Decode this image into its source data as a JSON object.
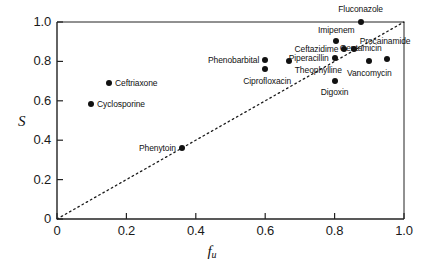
{
  "chart_data": {
    "type": "scatter",
    "title": "",
    "xlabel": "f_u",
    "xlabel_main": "f",
    "xlabel_sub": "u",
    "ylabel": "S",
    "xlim": [
      0,
      1.0
    ],
    "ylim": [
      0,
      1.0
    ],
    "xticks": [
      "0",
      "0.2",
      "0.4",
      "0.6",
      "0.8",
      "1.0"
    ],
    "xtick_values": [
      0,
      0.2,
      0.4,
      0.6,
      0.8,
      1.0
    ],
    "yticks": [
      "0",
      "0.2",
      "0.4",
      "0.6",
      "0.8",
      "1.0"
    ],
    "ytick_values": [
      0,
      0.2,
      0.4,
      0.6,
      0.8,
      1.0
    ],
    "grid": false,
    "legend": false,
    "marker_color": "#111111",
    "axis_color": "#222222",
    "reference_line": {
      "name": "identity-line",
      "style": "dotted",
      "from": [
        0,
        0
      ],
      "to": [
        1.0,
        1.0
      ]
    },
    "points": [
      {
        "label": "Fluconazole",
        "x": 0.875,
        "y": 1.0,
        "label_pos": "c",
        "dx": 0,
        "dy": -13
      },
      {
        "label": "Imipenem",
        "x": 0.805,
        "y": 0.905,
        "label_pos": "c",
        "dx": 0,
        "dy": -11
      },
      {
        "label": "Procainamide",
        "x": 0.855,
        "y": 0.865,
        "label_pos": "l",
        "dx": 6,
        "dy": -8
      },
      {
        "label": "Ceftazidime",
        "x": 0.828,
        "y": 0.865,
        "label_pos": "r",
        "dx": -6,
        "dy": 0
      },
      {
        "label": "Gentamicin",
        "x": 0.95,
        "y": 0.812,
        "label_pos": "r",
        "dx": -5,
        "dy": -11
      },
      {
        "label": "Piperacillin",
        "x": 0.8,
        "y": 0.818,
        "label_pos": "r",
        "dx": -6,
        "dy": 0
      },
      {
        "label": "Phenobarbital",
        "x": 0.6,
        "y": 0.805,
        "label_pos": "r",
        "dx": -6,
        "dy": 0
      },
      {
        "label": "Theophylline",
        "x": 0.668,
        "y": 0.8,
        "label_pos": "l",
        "dx": 6,
        "dy": 9
      },
      {
        "label": "Ciprofloxacin",
        "x": 0.6,
        "y": 0.76,
        "label_pos": "c",
        "dx": 2,
        "dy": 12
      },
      {
        "label": "Vancomycin",
        "x": 0.9,
        "y": 0.803,
        "label_pos": "c",
        "dx": 0,
        "dy": 12
      },
      {
        "label": "Digoxin",
        "x": 0.8,
        "y": 0.7,
        "label_pos": "c",
        "dx": 0,
        "dy": 11
      },
      {
        "label": "Ceftriaxone",
        "x": 0.15,
        "y": 0.69,
        "label_pos": "l",
        "dx": 6,
        "dy": 0
      },
      {
        "label": "Cyclosporine",
        "x": 0.098,
        "y": 0.582,
        "label_pos": "l",
        "dx": 6,
        "dy": 0
      },
      {
        "label": "Phenytoin",
        "x": 0.36,
        "y": 0.36,
        "label_pos": "r",
        "dx": -6,
        "dy": 0
      }
    ]
  }
}
